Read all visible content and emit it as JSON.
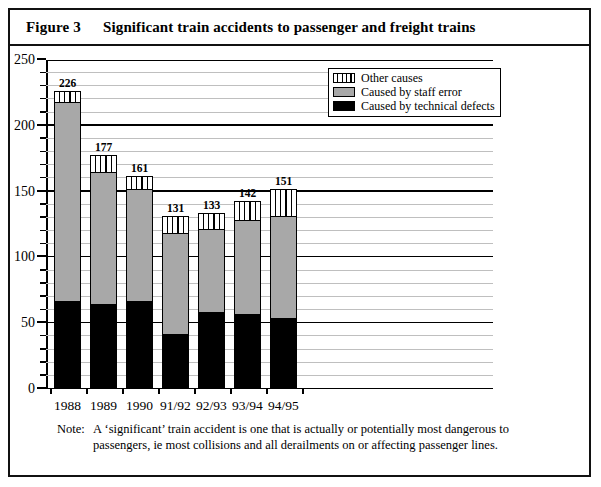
{
  "figure": {
    "number": "Figure 3",
    "title": "Significant train accidents to passenger and freight trains"
  },
  "note": {
    "label": "Note:",
    "text": "A ‘significant’ train accident is one that is actually or potentially most dangerous to passengers, ie most collisions and all derailments on or affecting passenger lines."
  },
  "legend": {
    "items": [
      {
        "label": "Other causes",
        "swatch": "striped-vertical",
        "color": "#ffffff"
      },
      {
        "label": "Caused by staff error",
        "swatch": "solid-gray",
        "color": "#a8a8a8"
      },
      {
        "label": "Caused by technical defects",
        "swatch": "solid-black",
        "color": "#000000"
      }
    ]
  },
  "chart_data": {
    "type": "bar",
    "stacked": true,
    "title": "Significant train accidents to passenger and freight trains",
    "xlabel": "",
    "ylabel": "",
    "ylim": [
      0,
      250
    ],
    "yticks": [
      0,
      50,
      100,
      150,
      200,
      250
    ],
    "ytick_labels": [
      "0",
      "50",
      "100",
      "150",
      "200",
      "250"
    ],
    "minor_tick_interval": 10,
    "grid": true,
    "legend_position": "top-right",
    "categories": [
      "1988",
      "1989",
      "1990",
      "91/92",
      "92/93",
      "93/94",
      "94/95"
    ],
    "series": [
      {
        "name": "Caused by technical defects",
        "color": "#000000",
        "values": [
          66,
          64,
          66,
          41,
          58,
          56,
          53
        ]
      },
      {
        "name": "Caused by staff error",
        "color": "#a8a8a8",
        "values": [
          151,
          100,
          85,
          77,
          63,
          72,
          78
        ]
      },
      {
        "name": "Other causes",
        "color": "#ffffff",
        "values": [
          9,
          13,
          10,
          13,
          12,
          14,
          20
        ]
      }
    ],
    "totals": [
      226,
      177,
      161,
      131,
      133,
      142,
      151
    ],
    "total_labels": [
      "226",
      "177",
      "161",
      "131",
      "133",
      "142",
      "151"
    ]
  }
}
